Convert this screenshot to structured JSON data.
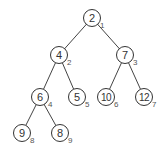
{
  "diagram": {
    "type": "binary-heap-tree",
    "edge_color": "#444444",
    "nodes": [
      {
        "value": "2",
        "index": "1",
        "x": 92,
        "y": 18
      },
      {
        "value": "4",
        "index": "2",
        "x": 59,
        "y": 55
      },
      {
        "value": "7",
        "index": "3",
        "x": 125,
        "y": 55
      },
      {
        "value": "6",
        "index": "4",
        "x": 40,
        "y": 97
      },
      {
        "value": "5",
        "index": "5",
        "x": 77,
        "y": 97
      },
      {
        "value": "10",
        "index": "6",
        "x": 106,
        "y": 97
      },
      {
        "value": "12",
        "index": "7",
        "x": 144,
        "y": 97
      },
      {
        "value": "9",
        "index": "8",
        "x": 22,
        "y": 133
      },
      {
        "value": "8",
        "index": "9",
        "x": 60,
        "y": 133
      }
    ],
    "edges": [
      [
        0,
        1
      ],
      [
        0,
        2
      ],
      [
        1,
        3
      ],
      [
        1,
        4
      ],
      [
        2,
        5
      ],
      [
        2,
        6
      ],
      [
        3,
        7
      ],
      [
        3,
        8
      ]
    ]
  }
}
